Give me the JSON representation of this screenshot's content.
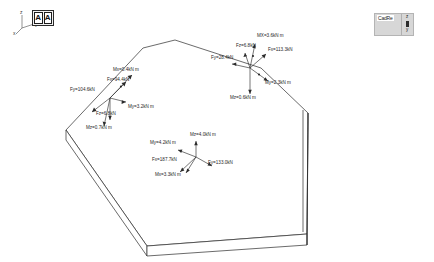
{
  "window": {
    "background_color": "#ffffff",
    "accent_color": "#2b2b2b"
  },
  "axis_triad": {
    "name": "global-axis-triad",
    "z_label": "z",
    "y_label": "y",
    "x_label": "x"
  },
  "aa_button": {
    "left_label": "A",
    "right_label": "A"
  },
  "cad_panel": {
    "brand": "CadRe",
    "sub": "",
    "axis_z": "z",
    "axis_y": "y"
  },
  "footer": {
    "credit": "CSEC - by Castalia srl - www.steelchecks.com - ver. 7.11 june 29 2016 - sn: 130000"
  },
  "diagram": {
    "clusters": [
      {
        "name": "left-load-cluster",
        "origin": {
          "x": 110,
          "y": 98
        },
        "labels": [
          {
            "id": "left-mx",
            "text": "Mx=0.4kN m",
            "x": 113,
            "y": 71
          },
          {
            "id": "left-fx",
            "text": "Fx=94.4kN",
            "x": 107,
            "y": 81
          },
          {
            "id": "left-fy",
            "text": "Fy=104.6kN",
            "x": 70,
            "y": 91
          },
          {
            "id": "left-my",
            "text": "My=3.2kN m",
            "x": 128,
            "y": 108
          },
          {
            "id": "left-fz",
            "text": "Fz=6.8kN",
            "x": 96,
            "y": 115
          },
          {
            "id": "left-mz",
            "text": "Mz=0.7kN m",
            "x": 86,
            "y": 129
          }
        ]
      },
      {
        "name": "right-load-cluster",
        "origin": {
          "x": 250,
          "y": 68
        },
        "labels": [
          {
            "id": "right-mx",
            "text": "MX=3.6kN m",
            "x": 257,
            "y": 37
          },
          {
            "id": "right-fz",
            "text": "Fz=6.8kN",
            "x": 236,
            "y": 47
          },
          {
            "id": "right-fx",
            "text": "Fx=113.3kN",
            "x": 268,
            "y": 51
          },
          {
            "id": "right-fy",
            "text": "Fy=28.4kN",
            "x": 211,
            "y": 59
          },
          {
            "id": "right-my",
            "text": "My=2.3kN m",
            "x": 265,
            "y": 84
          },
          {
            "id": "right-mz",
            "text": "Mz=0.6kN m",
            "x": 230,
            "y": 99
          }
        ]
      },
      {
        "name": "center-load-cluster",
        "origin": {
          "x": 196,
          "y": 157
        },
        "labels": [
          {
            "id": "center-mz",
            "text": "Mz=4.0kN m",
            "x": 190,
            "y": 136
          },
          {
            "id": "center-my",
            "text": "My=4.2kN m",
            "x": 150,
            "y": 144
          },
          {
            "id": "center-fx",
            "text": "Fx=187.7kN",
            "x": 152,
            "y": 161
          },
          {
            "id": "center-fy",
            "text": "Fy=133.0kN",
            "x": 208,
            "y": 164
          },
          {
            "id": "center-mx",
            "text": "Mx=3.3kN m",
            "x": 155,
            "y": 176
          }
        ]
      }
    ]
  }
}
